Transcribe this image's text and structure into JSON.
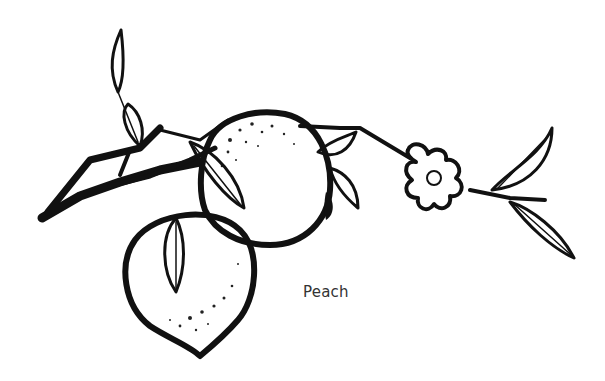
{
  "illustration": {
    "subject": "peach branch ink drawing",
    "elements": [
      "branch",
      "peach-fruit-upper",
      "peach-fruit-lower",
      "leaves",
      "blossom"
    ],
    "ink_color": "#111111",
    "background_color": "#ffffff"
  },
  "caption": {
    "text": "Peach"
  }
}
